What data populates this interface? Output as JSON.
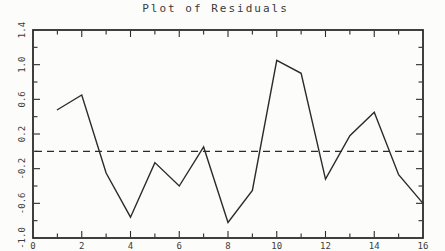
{
  "window": {
    "background": "#fcfcfa",
    "ink_color": "#2b2b2b",
    "label_color": "#3c3c3c"
  },
  "chart_data": {
    "type": "line",
    "title": "Plot of Residuals",
    "x": [
      1,
      2,
      3,
      4,
      5,
      6,
      7,
      8,
      9,
      10,
      11,
      12,
      13,
      14,
      15,
      16
    ],
    "series": [
      {
        "name": "residuals",
        "values": [
          0.48,
          0.65,
          -0.25,
          -0.76,
          -0.13,
          -0.4,
          0.05,
          -0.82,
          -0.45,
          1.05,
          0.9,
          -0.32,
          0.18,
          0.45,
          -0.27,
          -0.6
        ]
      }
    ],
    "xlabel": "",
    "ylabel": "",
    "xlim": [
      0,
      16
    ],
    "ylim": [
      -1.0,
      1.4
    ],
    "x_tick_values": [
      0,
      2,
      4,
      6,
      8,
      10,
      12,
      14,
      16
    ],
    "x_tick_labels": [
      "0",
      "2",
      "4",
      "6",
      "8",
      "10",
      "12",
      "14",
      "16"
    ],
    "x_minor_step": 1,
    "y_tick_values": [
      -1.0,
      -0.6,
      -0.2,
      0.2,
      0.6,
      1.0,
      1.4
    ],
    "y_tick_labels": [
      "-1.0",
      "-0.6",
      "-0.2",
      "0.2",
      "0.6",
      "1.0",
      "1.4"
    ],
    "y_minor_step": 0.2,
    "zero_line": {
      "y": 0,
      "style": "dashed"
    },
    "grid": false,
    "legend": null
  }
}
